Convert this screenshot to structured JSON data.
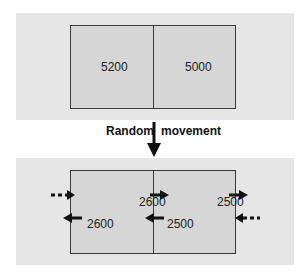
{
  "before": {
    "left_value": "5200",
    "right_value": "5000"
  },
  "transition": {
    "label_left": "Random",
    "label_right": "movement"
  },
  "after": {
    "left_to_right_center": "2600",
    "right_outflow": "2500",
    "left_outflow": "2600",
    "right_to_left_center": "2500"
  },
  "colors": {
    "panel": "#e6e6e6",
    "box": "#d6d6d6",
    "line": "#3a3a3a",
    "arrow": "#111111"
  }
}
